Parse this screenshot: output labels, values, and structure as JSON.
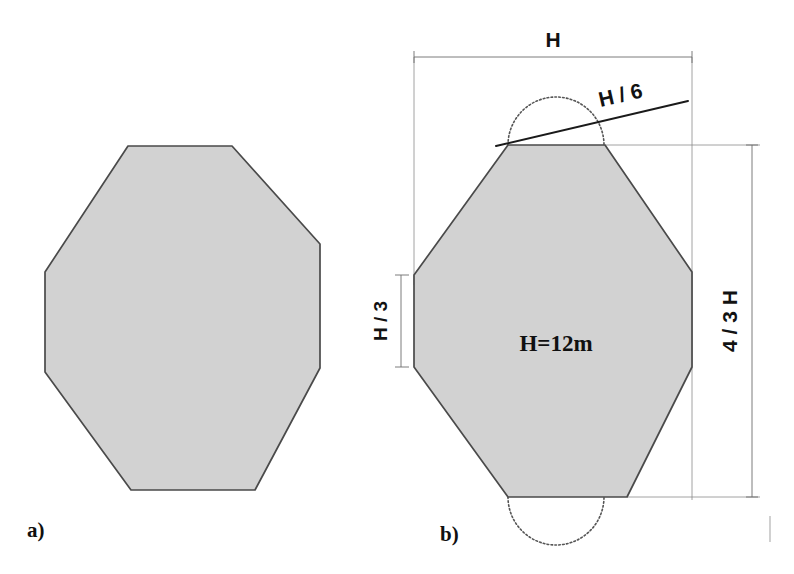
{
  "figure": {
    "background_color": "#ffffff",
    "fill_color": "#d2d2d2",
    "outline_color": "#4a4a4a",
    "dimension_color": "#6d6d6d"
  },
  "panels": [
    {
      "id": "a",
      "label": "a)",
      "description": "plain octagon outline",
      "shape_name": "octagon-plain"
    },
    {
      "id": "b",
      "label": "b)",
      "description": "dimensioned octagon with annotations",
      "shape_name": "octagon-dimensioned"
    }
  ],
  "annotations": {
    "width_label": "H",
    "height_label": "4 / 3 H",
    "side_label": "H / 3",
    "notch_label": "H / 6",
    "scale_note": "H=12m"
  },
  "geometry": {
    "panel_a": {
      "points": "128,146 232,146 320,244 320,368 255,490 131,490 45,372 45,272",
      "top_edge": [
        128,
        232
      ],
      "top_y": 146,
      "bottom_edge": [
        131,
        255
      ],
      "bottom_y": 490,
      "left_x": 45,
      "right_x": 320
    },
    "panel_b": {
      "points": "508,145 605,145 692,272 692,367 627,497 508,497 414,367 414,275",
      "top_edge": [
        508,
        605
      ],
      "top_y": 145,
      "bottom_edge": [
        508,
        627
      ],
      "bottom_y": 497,
      "left_x": 414,
      "right_x": 692
    },
    "arcs": {
      "top_semicircle": {
        "cx": 556,
        "cy": 145,
        "r": 48,
        "direction": "up"
      },
      "bottom_semicircle": {
        "cx": 556,
        "cy": 497,
        "r": 48,
        "direction": "down"
      }
    },
    "dimensions": {
      "width_line_y": 57,
      "width_line_x": [
        414,
        692
      ],
      "height_line_x": 752,
      "height_line_y": [
        145,
        497
      ],
      "side_line_x": 401,
      "side_line_y": [
        275,
        367
      ],
      "leader_from": [
        496,
        145
      ],
      "leader_to": [
        688,
        100
      ]
    }
  }
}
